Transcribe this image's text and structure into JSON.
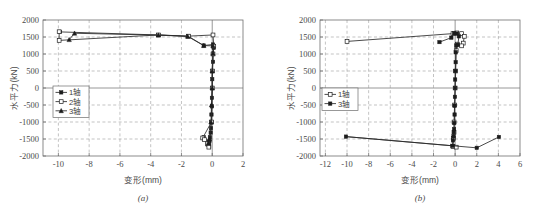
{
  "figure": {
    "panels": [
      {
        "caption": "(a)",
        "xlabel": "变形(mm)",
        "ylabel": "水平力(kN)",
        "xticks": [
          "-10",
          "-8",
          "-6",
          "-4",
          "-2",
          "0",
          "2"
        ],
        "yticks": [
          "2000",
          "1500",
          "1000",
          "500",
          "0",
          "-500",
          "-1000",
          "-1500",
          "-2000"
        ],
        "legend": [
          {
            "label": "1轴",
            "marker": "filled-square"
          },
          {
            "label": "2轴",
            "marker": "open-square"
          },
          {
            "label": "3轴",
            "marker": "filled-triangle"
          }
        ]
      },
      {
        "caption": "(b)",
        "xlabel": "变形(mm)",
        "ylabel": "水平力(kN)",
        "xticks": [
          "-12",
          "-10",
          "-8",
          "-6",
          "-4",
          "-2",
          "0",
          "2",
          "4",
          "6"
        ],
        "yticks": [
          "2000",
          "1500",
          "1000",
          "500",
          "0",
          "-500",
          "-1000",
          "-1500",
          "-2000"
        ],
        "legend": [
          {
            "label": "1轴",
            "marker": "open-square"
          },
          {
            "label": "3轴",
            "marker": "filled-square"
          }
        ]
      }
    ]
  },
  "chart_data": [
    {
      "type": "line",
      "title": "",
      "caption": "(a)",
      "xlabel": "变形(mm)",
      "ylabel": "水平力(kN)",
      "xlim": [
        -11,
        2
      ],
      "ylim": [
        -2000,
        2000
      ],
      "xticks": [
        -10,
        -8,
        -6,
        -4,
        -2,
        0,
        2
      ],
      "yticks": [
        -2000,
        -1500,
        -1000,
        -500,
        0,
        500,
        1000,
        1500,
        2000
      ],
      "grid": true,
      "legend_position": "center-left",
      "series": [
        {
          "name": "1轴",
          "marker": "filled-square",
          "points": [
            [
              -9.9,
              1650
            ],
            [
              -3.5,
              1560
            ],
            [
              -1.55,
              1520
            ],
            [
              -0.55,
              1250
            ],
            [
              0.05,
              1280
            ],
            [
              0.1,
              1180
            ],
            [
              0.05,
              1010
            ],
            [
              0.05,
              770
            ],
            [
              0.02,
              500
            ],
            [
              0.0,
              260
            ],
            [
              0.0,
              0
            ],
            [
              -0.02,
              -290
            ],
            [
              -0.02,
              -540
            ],
            [
              -0.05,
              -780
            ],
            [
              -0.05,
              -1010
            ],
            [
              -0.08,
              -1180
            ],
            [
              -0.1,
              -1310
            ],
            [
              -0.15,
              -1450
            ],
            [
              -0.18,
              -1560
            ],
            [
              -0.2,
              -1610
            ],
            [
              -0.55,
              -1450
            ],
            [
              -0.3,
              -1660
            ],
            [
              -0.2,
              -1720
            ]
          ]
        },
        {
          "name": "2轴",
          "marker": "open-square",
          "points": [
            [
              -9.95,
              1655
            ],
            [
              -9.95,
              1400
            ],
            [
              -3.5,
              1560
            ],
            [
              -1.55,
              1525
            ],
            [
              0.05,
              1560
            ],
            [
              0.1,
              1230
            ],
            [
              0.05,
              1000
            ],
            [
              0.0,
              500
            ],
            [
              0.0,
              0
            ],
            [
              -0.05,
              -1000
            ],
            [
              -0.62,
              -1470
            ],
            [
              -0.5,
              -1520
            ],
            [
              -0.3,
              -1640
            ],
            [
              -0.22,
              -1740
            ]
          ]
        },
        {
          "name": "3轴",
          "marker": "filled-triangle",
          "points": [
            [
              -9.3,
              1420
            ],
            [
              -8.95,
              1610
            ],
            [
              -3.5,
              1555
            ],
            [
              -1.6,
              1520
            ],
            [
              -0.55,
              1245
            ],
            [
              0.05,
              1240
            ],
            [
              0.05,
              1020
            ],
            [
              0.0,
              500
            ],
            [
              0.0,
              0
            ],
            [
              -0.05,
              -500
            ],
            [
              -0.08,
              -1000
            ],
            [
              -0.18,
              -1500
            ],
            [
              -0.25,
              -1620
            ]
          ]
        }
      ]
    },
    {
      "type": "line",
      "title": "",
      "caption": "(b)",
      "xlabel": "变形(mm)",
      "ylabel": "水平力(kN)",
      "xlim": [
        -12.5,
        6
      ],
      "ylim": [
        -2000,
        2000
      ],
      "xticks": [
        -12,
        -10,
        -8,
        -6,
        -4,
        -2,
        0,
        2,
        4,
        6
      ],
      "yticks": [
        -2000,
        -1500,
        -1000,
        -500,
        0,
        500,
        1000,
        1500,
        2000
      ],
      "grid": true,
      "legend_position": "center-left",
      "series": [
        {
          "name": "1轴",
          "marker": "open-square",
          "points": [
            [
              -10.0,
              1370
            ],
            [
              -0.2,
              1600
            ],
            [
              0.15,
              1620
            ],
            [
              0.6,
              1600
            ],
            [
              0.85,
              1520
            ],
            [
              0.75,
              1320
            ],
            [
              0.6,
              1240
            ],
            [
              0.2,
              1290
            ],
            [
              0.1,
              1100
            ],
            [
              0.05,
              500
            ],
            [
              0.0,
              0
            ],
            [
              -0.05,
              -500
            ],
            [
              -0.1,
              -1000
            ],
            [
              -0.1,
              -1300
            ],
            [
              -0.15,
              -1480
            ],
            [
              -0.2,
              -1720
            ],
            [
              0.1,
              -1740
            ]
          ]
        },
        {
          "name": "3轴",
          "marker": "filled-square",
          "points": [
            [
              -1.45,
              1350
            ],
            [
              -0.35,
              1480
            ],
            [
              -0.1,
              1610
            ],
            [
              0.15,
              1600
            ],
            [
              0.35,
              1520
            ],
            [
              0.25,
              1270
            ],
            [
              0.1,
              1250
            ],
            [
              0.05,
              1050
            ],
            [
              0.05,
              760
            ],
            [
              0.02,
              500
            ],
            [
              0.0,
              250
            ],
            [
              0.0,
              0
            ],
            [
              -0.02,
              -260
            ],
            [
              -0.05,
              -520
            ],
            [
              -0.05,
              -780
            ],
            [
              -0.08,
              -1030
            ],
            [
              -0.1,
              -1210
            ],
            [
              -0.12,
              -1300
            ],
            [
              -0.15,
              -1420
            ],
            [
              -0.2,
              -1540
            ],
            [
              -0.25,
              -1700
            ],
            [
              -10.1,
              -1430
            ],
            [
              2.0,
              -1760
            ],
            [
              4.05,
              -1440
            ]
          ]
        }
      ]
    }
  ]
}
